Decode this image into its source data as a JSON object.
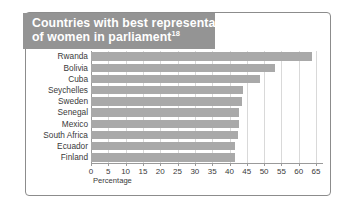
{
  "title": {
    "line1": "Countries with best representation",
    "line2": "of women in parliament",
    "footnote_marker": "18",
    "band_color": "#949494",
    "text_color": "#ffffff"
  },
  "axis_title": "Percentage",
  "colors": {
    "bar": "#a9a9a9",
    "gridline": "#d9d9d9",
    "axis": "#9a9a9a",
    "frame": "#8c8c8c",
    "background": "#ffffff",
    "label_text": "#3a3a3a"
  },
  "chart_data": {
    "type": "bar",
    "orientation": "horizontal",
    "title": "Countries with best representation of women in parliament",
    "xlabel": "Percentage",
    "ylabel": "",
    "xlim": [
      0,
      67
    ],
    "xticks": [
      0,
      5,
      10,
      15,
      20,
      25,
      30,
      35,
      40,
      45,
      50,
      55,
      60,
      65
    ],
    "grid": true,
    "legend": "none",
    "categories": [
      "Rwanda",
      "Bolivia",
      "Cuba",
      "Seychelles",
      "Sweden",
      "Senegal",
      "Mexico",
      "South Africa",
      "Ecuador",
      "Finland"
    ],
    "values": [
      63.8,
      53.1,
      48.9,
      43.8,
      43.6,
      42.7,
      42.6,
      42.4,
      41.6,
      41.5
    ],
    "units": "percent"
  }
}
